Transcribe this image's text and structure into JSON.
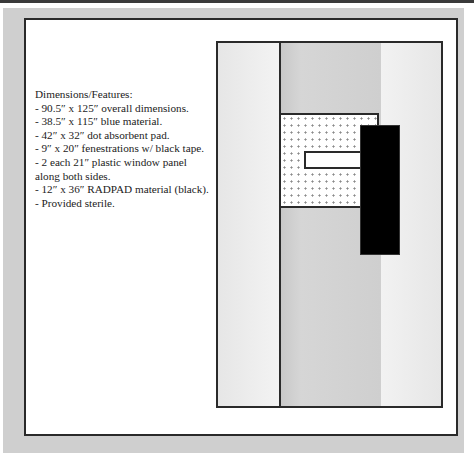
{
  "description": {
    "heading": "Dimensions/Features:",
    "lines": [
      "- 90.5″ x 125″ overall dimensions.",
      "- 38.5″ x 115″ blue material.",
      "- 42″ x 32″ dot absorbent pad.",
      "- 9″ x 20″ fenestrations w/ black tape.",
      "- 2 each 21″  plastic window panel",
      "along both sides.",
      "- 12″ x 36″ RADPAD material (black).",
      "- Provided sterile."
    ]
  },
  "diagram": {
    "components": [
      "plastic window panel (left)",
      "blue material (center)",
      "plastic window panel (right)",
      "dot absorbent pad",
      "fenestration",
      "RADPAD material (black)"
    ],
    "colors": {
      "outline": "#2a2a2a",
      "center_panel": "#cfcfcf",
      "side_panel": "#eeeeee",
      "radpad": "#000000",
      "border_bg": "#cfcfcf"
    }
  }
}
